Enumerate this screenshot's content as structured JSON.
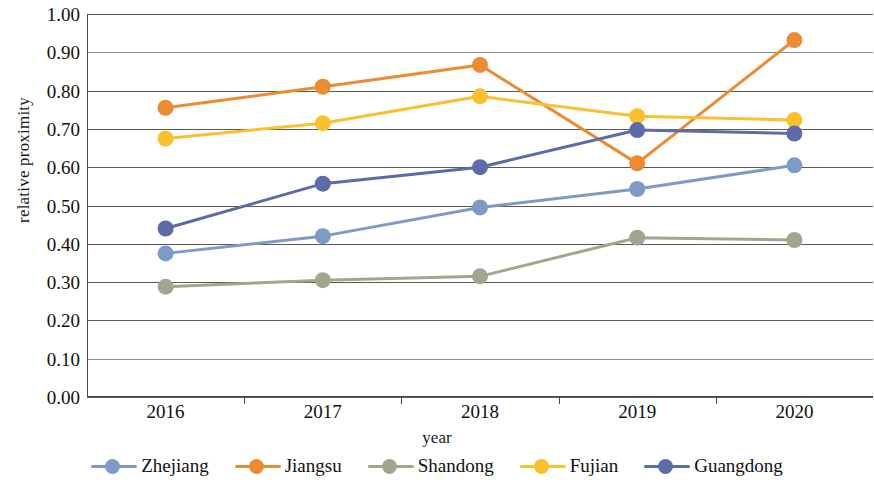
{
  "chart_data": {
    "type": "line",
    "title": "",
    "xlabel": "year",
    "ylabel": "relative proximity",
    "categories": [
      "2016",
      "2017",
      "2018",
      "2019",
      "2020"
    ],
    "ylim": [
      0.0,
      1.0
    ],
    "ytick_labels": [
      "1.00",
      "0.90",
      "0.80",
      "0.70",
      "0.60",
      "0.50",
      "0.40",
      "0.30",
      "0.20",
      "0.10",
      "0.00"
    ],
    "ytick_values": [
      1.0,
      0.9,
      0.8,
      0.7,
      0.6,
      0.5,
      0.4,
      0.3,
      0.2,
      0.1,
      0.0
    ],
    "grid": true,
    "legend_position": "bottom",
    "series": [
      {
        "name": "Zhejiang",
        "color": "#7E9BC8",
        "values": [
          0.375,
          0.42,
          0.495,
          0.543,
          0.605
        ]
      },
      {
        "name": "Jiangsu",
        "color": "#ED8B33",
        "values": [
          0.755,
          0.81,
          0.867,
          0.61,
          0.932
        ]
      },
      {
        "name": "Shandong",
        "color": "#A3A68E",
        "values": [
          0.288,
          0.305,
          0.315,
          0.416,
          0.41
        ]
      },
      {
        "name": "Fujian",
        "color": "#FAC githubC23",
        "values": [
          0.675,
          0.715,
          0.785,
          0.733,
          0.723
        ]
      },
      {
        "name": "Guangdong",
        "color": "#5B6CA8",
        "values": [
          0.44,
          0.557,
          0.6,
          0.697,
          0.688
        ]
      }
    ]
  },
  "axes": {
    "y_title": "relative proximity",
    "x_title": "year"
  }
}
